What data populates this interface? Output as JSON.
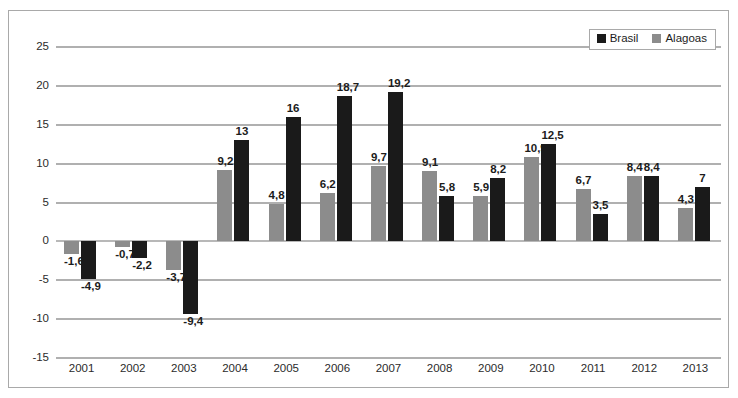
{
  "chart_data": {
    "type": "bar",
    "title": "",
    "subtitle": "",
    "xlabel": "",
    "ylabel": "",
    "ylim": [
      -15,
      25
    ],
    "yticks": [
      25,
      20,
      15,
      10,
      5,
      0,
      -5,
      -10,
      -15
    ],
    "ytick_labels": [
      "25",
      "20",
      "15",
      "10",
      "5",
      "0",
      "-5",
      "-10",
      "-15"
    ],
    "grid": true,
    "legend_position": "top-right",
    "decimal_separator": ",",
    "categories": [
      "2001",
      "2002",
      "2003",
      "2004",
      "2005",
      "2006",
      "2007",
      "2008",
      "2009",
      "2010",
      "2011",
      "2012",
      "2013"
    ],
    "series": [
      {
        "name": "Alagoas",
        "color": "#8c8c8c",
        "values": [
          -1.6,
          -0.7,
          -3.7,
          9.2,
          4.8,
          6.2,
          9.7,
          9.1,
          5.9,
          10.9,
          6.7,
          8.4,
          4.3
        ],
        "labels": [
          "-1,6",
          "-0,7",
          "-3,7",
          "9,2",
          "4,8",
          "6,2",
          "9,7",
          "9,1",
          "5,9",
          "10,9",
          "6,7",
          "8,4",
          "4,3"
        ]
      },
      {
        "name": "Brasil",
        "color": "#1a1a1a",
        "values": [
          -4.9,
          -2.2,
          -9.4,
          13,
          16,
          18.7,
          19.2,
          5.8,
          8.2,
          12.5,
          3.5,
          8.4,
          7
        ],
        "labels": [
          "-4,9",
          "-2,2",
          "-9,4",
          "13",
          "16",
          "18,7",
          "19,2",
          "5,8",
          "8,2",
          "12,5",
          "3,5",
          "8,4",
          "7"
        ]
      }
    ]
  },
  "legend": {
    "items": [
      {
        "label": "Brasil",
        "color": "#1a1a1a"
      },
      {
        "label": "Alagoas",
        "color": "#8c8c8c"
      }
    ]
  }
}
